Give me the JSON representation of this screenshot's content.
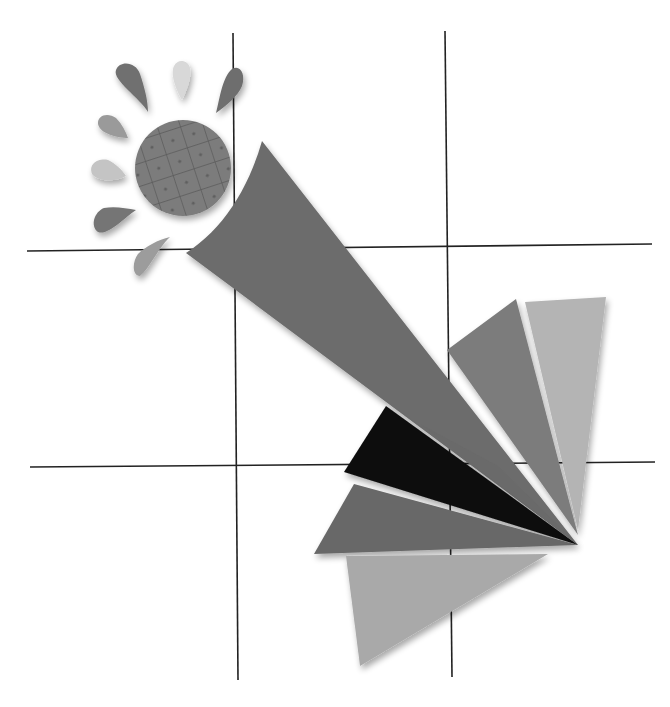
{
  "illustration": {
    "title": "Paper-craft sun with fanned rays",
    "style": "grayscale collage",
    "background": "#ffffff",
    "grid": {
      "color": "#222222",
      "vertical_lines": [
        {
          "x1": 233,
          "y1": 33,
          "x2": 238,
          "y2": 680
        },
        {
          "x1": 445,
          "y1": 31,
          "x2": 452,
          "y2": 677
        }
      ],
      "horizontal_lines": [
        {
          "x1": 27,
          "y1": 251,
          "x2": 652,
          "y2": 244
        },
        {
          "x1": 30,
          "y1": 467,
          "x2": 655,
          "y2": 462
        }
      ]
    },
    "sun": {
      "disk": {
        "cx": 183,
        "cy": 168,
        "r": 48,
        "color": "#7a7a7a",
        "pattern": "cross-hatch with dots"
      },
      "petals": [
        {
          "name": "petal-top-left",
          "color": "#707070"
        },
        {
          "name": "petal-top",
          "color": "#d8d8d8"
        },
        {
          "name": "petal-top-right",
          "color": "#6e6e6e"
        },
        {
          "name": "petal-left-upper",
          "color": "#9a9a9a"
        },
        {
          "name": "petal-left-middle",
          "color": "#c4c4c4"
        },
        {
          "name": "petal-left-lower",
          "color": "#747474"
        },
        {
          "name": "petal-bottom",
          "color": "#9c9c9c"
        }
      ]
    },
    "beam": {
      "color": "#6c6c6c"
    },
    "fan": {
      "pivot": {
        "x": 578,
        "y": 545
      },
      "blades": [
        {
          "name": "blade-light-upper",
          "color": "#b4b4b4"
        },
        {
          "name": "blade-mid-upper",
          "color": "#7c7c7c"
        },
        {
          "name": "blade-black",
          "color": "#0c0c0c"
        },
        {
          "name": "blade-dark-lower",
          "color": "#686868"
        },
        {
          "name": "blade-light-bottom",
          "color": "#a9a9a9"
        }
      ]
    }
  }
}
